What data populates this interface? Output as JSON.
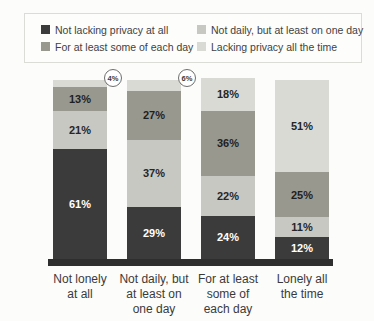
{
  "legend": {
    "items": [
      {
        "label": "Not lacking privacy at all",
        "color": "#3b3b3b"
      },
      {
        "label": "Not daily, but at least on one day",
        "color": "#c8c8c3"
      },
      {
        "label": "For at least some of each day",
        "color": "#98988f"
      },
      {
        "label": "Lacking privacy all the time",
        "color": "#dadad4"
      }
    ]
  },
  "chart_data": {
    "type": "bar",
    "stacked": true,
    "orientation": "vertical",
    "legend_position": "top",
    "ylim": [
      0,
      100
    ],
    "value_suffix": "%",
    "label_min_value": 10,
    "categories": [
      "Not lonely\nat all",
      "Not daily, but\nat least on\none day",
      "For at least\nsome of\neach day",
      "Lonely all\nthe time"
    ],
    "series": [
      {
        "name": "Not lacking privacy at all",
        "color": "#3b3b3b",
        "label_color": "#ffffff",
        "values": [
          61,
          29,
          24,
          12
        ]
      },
      {
        "name": "Not daily, but at least on one day",
        "color": "#c8c8c3",
        "label_color": "#262626",
        "values": [
          21,
          37,
          22,
          11
        ]
      },
      {
        "name": "For at least some of each day",
        "color": "#98988f",
        "label_color": "#1f1f1f",
        "values": [
          13,
          27,
          36,
          25
        ]
      },
      {
        "name": "Lacking privacy all the time",
        "color": "#dadad4",
        "label_color": "#262626",
        "values": [
          4,
          6,
          18,
          51
        ]
      }
    ],
    "annotations": [
      {
        "category_index": 0,
        "text": "4%"
      },
      {
        "category_index": 1,
        "text": "6%"
      }
    ]
  },
  "colors": {
    "background": "#fcfcfa",
    "baseline": "#2e2e2e",
    "legend_border": "#dcdcd6",
    "annotation_border": "#6e6e6e"
  }
}
